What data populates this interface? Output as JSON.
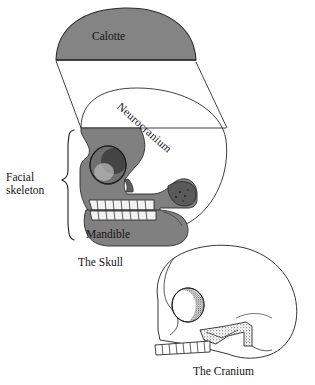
{
  "figure": {
    "background_color": "#ffffff",
    "ink_color": "#141414",
    "bone_fill_color": "#ffffff",
    "highlight_fill_color": "#808080"
  },
  "panels": [
    {
      "id": "skull",
      "caption": "The Skull",
      "parts": [
        {
          "id": "calotte",
          "label": "Calotte",
          "fill": "#808080"
        },
        {
          "id": "neurocranium",
          "label": "Neurocranium",
          "fill": "#ffffff",
          "rotation_deg": 42
        },
        {
          "id": "facial-skeleton",
          "label": "Facial skeleton",
          "fill": "#808080",
          "bracket": true
        },
        {
          "id": "mandible",
          "label": "Mandible",
          "fill": "#808080"
        }
      ]
    },
    {
      "id": "cranium",
      "caption": "The Cranium",
      "parts": [
        {
          "id": "cranial-vault",
          "label": "",
          "fill": "#ffffff"
        },
        {
          "id": "orbit",
          "label": "",
          "fill": "#ffffff"
        },
        {
          "id": "zygomatic-arch",
          "label": "",
          "fill": "#ffffff"
        },
        {
          "id": "maxillary-teeth",
          "label": "",
          "fill": "#ffffff"
        }
      ]
    }
  ],
  "labels": {
    "calotte": "Calotte",
    "neurocranium": "Neurocranium",
    "facial_skeleton_line1": "Facial",
    "facial_skeleton_line2": "skeleton",
    "mandible": "Mandible",
    "the_skull": "The Skull",
    "the_cranium": "The Cranium"
  }
}
